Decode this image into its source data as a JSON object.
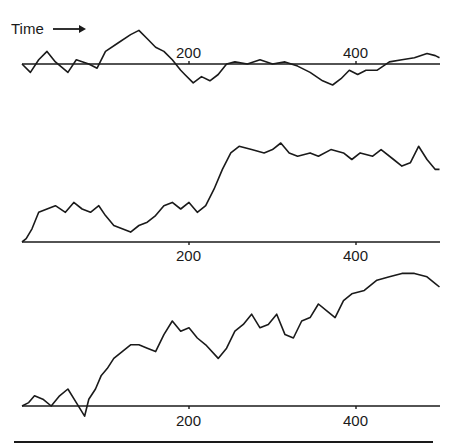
{
  "chart_data": [
    {
      "type": "line",
      "title": "",
      "annotation": "Time →",
      "xlabel": "",
      "ylabel": "",
      "xlim": [
        0,
        500
      ],
      "x_ticks": [
        200,
        400
      ],
      "x_tick_labels": [
        "200",
        "400"
      ],
      "grid": false,
      "baseline": 0,
      "series": [
        {
          "name": "random walk 1",
          "x": [
            0,
            10,
            20,
            30,
            40,
            55,
            65,
            80,
            90,
            100,
            115,
            130,
            140,
            150,
            160,
            170,
            180,
            190,
            195,
            205,
            215,
            225,
            235,
            245,
            255,
            270,
            285,
            300,
            315,
            330,
            345,
            360,
            372,
            382,
            392,
            402,
            412,
            425,
            440,
            455,
            470,
            485,
            495,
            500
          ],
          "values": [
            0,
            -4,
            2,
            6,
            1,
            -4,
            2,
            0,
            -2,
            6,
            10,
            14,
            16,
            12,
            8,
            6,
            2,
            -3,
            -5,
            -9,
            -6,
            -8,
            -5,
            0,
            1,
            0,
            2,
            0,
            1,
            -1,
            -4,
            -8,
            -10,
            -7,
            -3,
            -5,
            -3,
            -3,
            1,
            2,
            3,
            5,
            4,
            3
          ]
        }
      ]
    },
    {
      "type": "line",
      "title": "",
      "xlabel": "",
      "ylabel": "",
      "xlim": [
        0,
        500
      ],
      "x_ticks": [
        200,
        400
      ],
      "x_tick_labels": [
        "200",
        "400"
      ],
      "grid": false,
      "baseline": 0,
      "series": [
        {
          "name": "random walk 2",
          "x": [
            0,
            5,
            12,
            20,
            30,
            40,
            52,
            62,
            72,
            82,
            92,
            100,
            110,
            120,
            130,
            140,
            150,
            160,
            170,
            180,
            190,
            200,
            210,
            220,
            230,
            240,
            250,
            260,
            275,
            290,
            300,
            310,
            320,
            330,
            345,
            355,
            370,
            385,
            395,
            405,
            420,
            430,
            445,
            455,
            465,
            475,
            485,
            495,
            500
          ],
          "values": [
            0,
            1,
            4,
            9,
            10,
            11,
            9,
            12,
            10,
            9,
            11,
            8,
            5,
            4,
            3,
            5,
            6,
            8,
            11,
            12,
            10,
            12,
            9,
            11,
            16,
            22,
            27,
            29,
            28,
            27,
            28,
            30,
            27,
            26,
            27,
            26,
            28,
            27,
            25,
            27,
            26,
            28,
            25,
            23,
            24,
            29,
            25,
            22,
            22
          ]
        }
      ]
    },
    {
      "type": "line",
      "title": "",
      "xlabel": "",
      "ylabel": "",
      "xlim": [
        0,
        500
      ],
      "x_ticks": [
        200,
        400
      ],
      "x_tick_labels": [
        "200",
        "400"
      ],
      "grid": false,
      "baseline": 0,
      "series": [
        {
          "name": "random walk 3",
          "x": [
            0,
            8,
            15,
            25,
            35,
            45,
            55,
            65,
            75,
            80,
            88,
            95,
            102,
            110,
            120,
            130,
            140,
            150,
            160,
            170,
            180,
            190,
            200,
            210,
            220,
            235,
            245,
            255,
            265,
            275,
            285,
            295,
            305,
            315,
            325,
            335,
            345,
            355,
            365,
            375,
            385,
            395,
            410,
            425,
            440,
            455,
            470,
            485,
            495,
            500
          ],
          "values": [
            0,
            1,
            3,
            2,
            0,
            3,
            5,
            1,
            -3,
            2,
            5,
            9,
            11,
            14,
            16,
            18,
            18,
            17,
            16,
            21,
            25,
            22,
            23,
            20,
            18,
            14,
            17,
            22,
            24,
            27,
            23,
            24,
            27,
            21,
            20,
            25,
            26,
            30,
            28,
            26,
            31,
            33,
            34,
            37,
            38,
            39,
            39,
            38,
            36,
            35
          ]
        }
      ]
    }
  ],
  "labels": {
    "time": "Time",
    "panel1_tick_200": "200",
    "panel1_tick_400": "400",
    "panel2_tick_200": "200",
    "panel2_tick_400": "400",
    "panel3_tick_200": "200",
    "panel3_tick_400": "400"
  }
}
